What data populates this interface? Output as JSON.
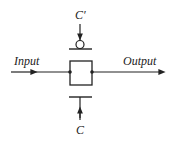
{
  "diagram": {
    "type": "transmission-gate",
    "labels": {
      "input": "Input",
      "output": "Output",
      "control_bar": "C′",
      "control": "C"
    },
    "colors": {
      "stroke": "#222222",
      "background": "#ffffff"
    }
  }
}
